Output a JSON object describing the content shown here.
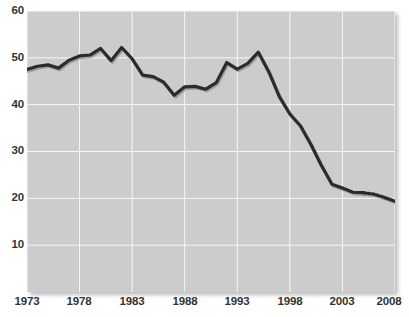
{
  "chart_data": {
    "type": "line",
    "title": "",
    "subtitle": "",
    "xlabel": "",
    "ylabel": "",
    "xlim": [
      1973,
      2008
    ],
    "ylim": [
      0,
      60
    ],
    "grid": true,
    "legend": null,
    "xticks": [
      "1973",
      "1978",
      "1983",
      "1988",
      "1993",
      "1998",
      "2003",
      "2008"
    ],
    "xtick_values": [
      1973,
      1978,
      1983,
      1988,
      1993,
      1998,
      2003,
      2008
    ],
    "yticks": [
      "10",
      "20",
      "30",
      "40",
      "50",
      "60"
    ],
    "ytick_values": [
      10,
      20,
      30,
      40,
      50,
      60
    ],
    "series": [
      {
        "name": "value",
        "line_color": "#2b2b2b",
        "line_width": 3.2,
        "dashed_range": [
          2005,
          2006.5
        ],
        "x": [
          1973,
          1974,
          1975,
          1976,
          1977,
          1978,
          1979,
          1980,
          1981,
          1982,
          1983,
          1984,
          1985,
          1986,
          1987,
          1988,
          1989,
          1990,
          1991,
          1992,
          1993,
          1994,
          1995,
          1996,
          1997,
          1998,
          1999,
          2000,
          2001,
          2002,
          2003,
          2004,
          2005,
          2006,
          2007,
          2008
        ],
        "values": [
          47.5,
          48.2,
          48.5,
          47.8,
          49.5,
          50.4,
          50.6,
          52.0,
          49.4,
          52.2,
          49.8,
          46.3,
          46.0,
          44.8,
          42.0,
          43.8,
          43.9,
          43.3,
          44.7,
          49.0,
          47.6,
          48.8,
          51.2,
          47.0,
          41.7,
          38.0,
          35.5,
          31.5,
          27.0,
          23.0,
          22.2,
          21.3,
          21.2,
          20.9,
          20.2,
          19.4
        ]
      }
    ]
  }
}
